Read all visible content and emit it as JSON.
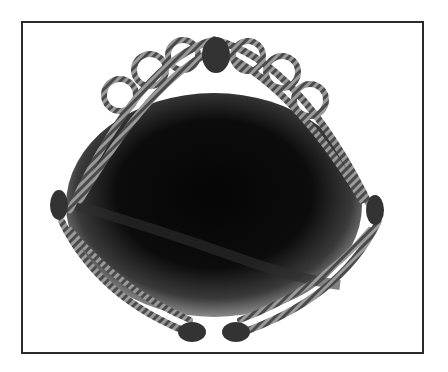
{
  "image": {
    "subject": "wire-wrapped cabochon pendant",
    "colors": {
      "frame": "#2a2a2a",
      "background": "#ffffff",
      "stone_center": "#0a0a0a",
      "stone_edge": "#6a6a6a",
      "wire": "#3a3a3a",
      "wire_highlight": "#9a9a9a"
    }
  }
}
